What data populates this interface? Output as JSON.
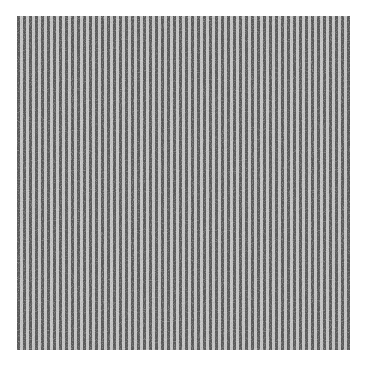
{
  "image": {
    "description": "Noisy vertical grating texture (stripes) on a white background",
    "texture": {
      "orientation": "vertical",
      "stripe_period_px": 6,
      "dark_color": "#5c5c5c",
      "light_color": "#c4c4c4",
      "background_color": "#ffffff",
      "noise": true
    }
  }
}
